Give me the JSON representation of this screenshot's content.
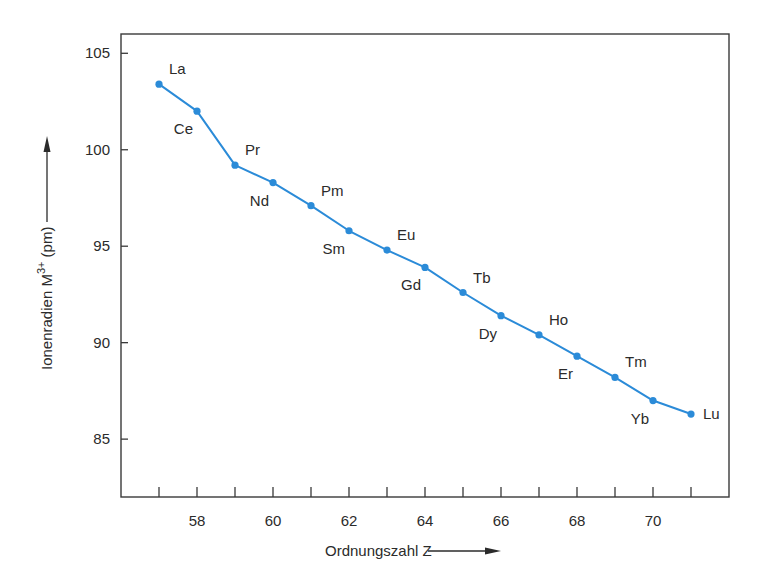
{
  "chart_data": {
    "type": "line",
    "title": "",
    "xlabel": "Ordnungszahl Z",
    "ylabel_parts": {
      "prefix": "Ionenradien M",
      "superscript": "3+",
      "suffix": " (pm)"
    },
    "ylabel": "Ionenradien M3+ (pm)",
    "xlim": [
      56,
      72
    ],
    "ylim": [
      82,
      106
    ],
    "x_ticks_minor": [
      57,
      58,
      59,
      60,
      61,
      62,
      63,
      64,
      65,
      66,
      67,
      68,
      69,
      70,
      71
    ],
    "x_tick_labels": [
      "58",
      "60",
      "62",
      "64",
      "66",
      "68",
      "70"
    ],
    "x_tick_label_values": [
      58,
      60,
      62,
      64,
      66,
      68,
      70
    ],
    "y_ticks": [
      85,
      90,
      95,
      100,
      105
    ],
    "y_tick_labels": [
      "85",
      "90",
      "95",
      "100",
      "105"
    ],
    "grid": false,
    "legend": "none",
    "series": [
      {
        "name": "Ionenradien M3+",
        "color": "#2b8bd8",
        "x": [
          57,
          58,
          59,
          60,
          61,
          62,
          63,
          64,
          65,
          66,
          67,
          68,
          69,
          70,
          71
        ],
        "values": [
          103.4,
          102.0,
          99.2,
          98.3,
          97.1,
          95.8,
          94.8,
          93.9,
          92.6,
          91.4,
          90.4,
          89.3,
          88.2,
          87.0,
          86.3
        ],
        "labels": [
          "La",
          "Ce",
          "Pr",
          "Nd",
          "Pm",
          "Sm",
          "Eu",
          "Gd",
          "Tb",
          "Dy",
          "Ho",
          "Er",
          "Tm",
          "Yb",
          "Lu"
        ],
        "label_positions": [
          "above-right",
          "below-left",
          "above-right",
          "below-left",
          "above-right",
          "below-left",
          "above-right",
          "below-left",
          "above-right",
          "below-left",
          "above-right",
          "below-left",
          "above-right",
          "below-left",
          "right"
        ]
      }
    ],
    "axis_color": "#3a3a3a"
  }
}
